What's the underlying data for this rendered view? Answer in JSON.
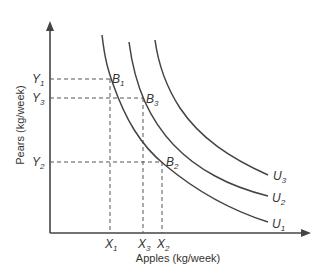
{
  "diagram": {
    "type": "indifference-curves",
    "x_axis_label": "Apples (kg/week)",
    "y_axis_label": "Pears (kg/week)",
    "colors": {
      "line": "#444444",
      "text": "#333333",
      "background": "#ffffff"
    },
    "x_ticks": [
      {
        "name": "X",
        "sub": "1"
      },
      {
        "name": "X",
        "sub": "3"
      },
      {
        "name": "X",
        "sub": "2"
      }
    ],
    "y_ticks": [
      {
        "name": "Y",
        "sub": "1"
      },
      {
        "name": "Y",
        "sub": "3"
      },
      {
        "name": "Y",
        "sub": "2"
      }
    ],
    "points": [
      {
        "name": "B",
        "sub": "1",
        "x": "X1",
        "y": "Y1",
        "curve": "U1"
      },
      {
        "name": "B",
        "sub": "3",
        "x": "X3",
        "y": "Y3",
        "curve": "U2"
      },
      {
        "name": "B",
        "sub": "2",
        "x": "X2",
        "y": "Y2",
        "curve": "U1"
      }
    ],
    "curves": [
      {
        "name": "U",
        "sub": "1"
      },
      {
        "name": "U",
        "sub": "2"
      },
      {
        "name": "U",
        "sub": "3"
      }
    ]
  }
}
